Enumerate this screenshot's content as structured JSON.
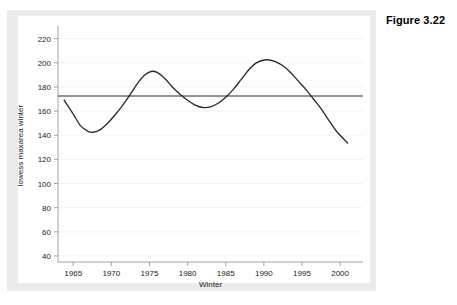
{
  "figure": {
    "label": "Figure 3.22"
  },
  "top_remnant": {
    "text": "................."
  },
  "chart_data": {
    "type": "line",
    "title": "",
    "subtitle": "",
    "xlabel": "Winter",
    "ylabel": "lowess maxarea winter",
    "xlim": [
      1963,
      2003
    ],
    "ylim": [
      35,
      228
    ],
    "xticks": [
      1965,
      1970,
      1975,
      1980,
      1985,
      1990,
      1995,
      2000
    ],
    "xtick_labels": [
      "1965",
      "1970",
      "1975",
      "1980",
      "1985",
      "1990",
      "1995",
      "2000"
    ],
    "yticks": [
      40,
      60,
      80,
      100,
      120,
      140,
      160,
      180,
      200,
      220
    ],
    "ytick_labels": [
      "40",
      "60",
      "80",
      "100",
      "120",
      "140",
      "160",
      "180",
      "200",
      "220"
    ],
    "grid": "horizontal",
    "legend": "none",
    "annotations": [],
    "reference_lines": [
      {
        "name": "mean-reference-line",
        "orientation": "horizontal",
        "value": 172.5,
        "color": "#2b2b2b"
      }
    ],
    "series": [
      {
        "name": "lowess maxarea winter",
        "color": "#2b2b2b",
        "x": [
          1963.8,
          1965.0,
          1966.0,
          1967.0,
          1967.6,
          1968.5,
          1969.5,
          1970.5,
          1971.5,
          1972.5,
          1973.5,
          1974.3,
          1975.2,
          1976.0,
          1977.0,
          1978.0,
          1979.0,
          1980.0,
          1981.0,
          1982.0,
          1983.0,
          1984.0,
          1985.0,
          1986.0,
          1987.0,
          1988.0,
          1989.0,
          1990.3,
          1991.5,
          1992.5,
          1993.5,
          1994.5,
          1995.5,
          1996.5,
          1997.5,
          1998.5,
          1999.5,
          2001.0
        ],
        "y": [
          169.0,
          157.5,
          147.5,
          143.0,
          142.5,
          144.5,
          150.0,
          157.0,
          165.0,
          174.0,
          183.5,
          189.5,
          192.8,
          192.0,
          187.0,
          180.0,
          174.0,
          169.0,
          165.0,
          163.0,
          163.5,
          166.5,
          171.5,
          178.0,
          186.0,
          194.0,
          200.0,
          202.5,
          201.0,
          197.5,
          192.0,
          185.0,
          178.0,
          170.0,
          162.0,
          152.5,
          143.5,
          133.5
        ]
      }
    ]
  }
}
